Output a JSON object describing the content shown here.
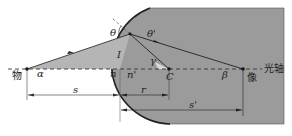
{
  "diagram": {
    "colors": {
      "glass": "#9b9b9b",
      "glass_edge": "#222222",
      "ray": "#333333",
      "shaded_wedge": "#c8c8c8",
      "background": "#ffffff"
    },
    "labels": {
      "object": "物",
      "image": "像",
      "optical_axis": "光轴",
      "theta": "θ",
      "theta_prime": "θ'",
      "incidence_height": "I",
      "alpha": "α",
      "n": "n",
      "n_prime": "n'",
      "gamma": "γ",
      "center": "C",
      "beta": "β",
      "s": "s",
      "r": "r",
      "s_prime": "s'"
    }
  }
}
